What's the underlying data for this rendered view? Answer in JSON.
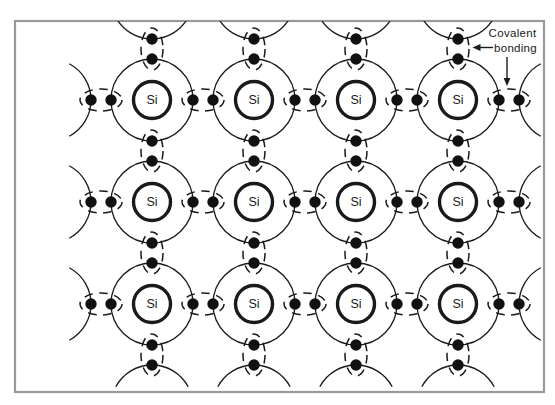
{
  "figure": {
    "type": "diagram",
    "atom_symbol": "Si",
    "annotation": {
      "line1": "Covalent",
      "line2": "bonding"
    },
    "colors": {
      "stroke": "#1a1a1a",
      "electron": "#111111",
      "frame": "#999999",
      "background": "#ffffff"
    },
    "lattice": {
      "atom_cols_x": [
        152,
        254,
        356,
        458
      ],
      "atom_rows_y": [
        100,
        202,
        304
      ],
      "spacing": 102,
      "outer_shell_radius": 41,
      "outer_shell_stroke": 1.3,
      "inner_circle_radius": 18.5,
      "inner_circle_stroke": 3.4,
      "electron_radius": 5.7,
      "electron_pair_offset": 10,
      "bond_ellipse_rx": 21,
      "bond_ellipse_ry": 11,
      "bond_ellipse_dash": "8.5 6.5",
      "edge_arc_half_angle": 62
    },
    "frame": {
      "x": 15,
      "y": 21,
      "width": 529,
      "height": 371
    }
  }
}
